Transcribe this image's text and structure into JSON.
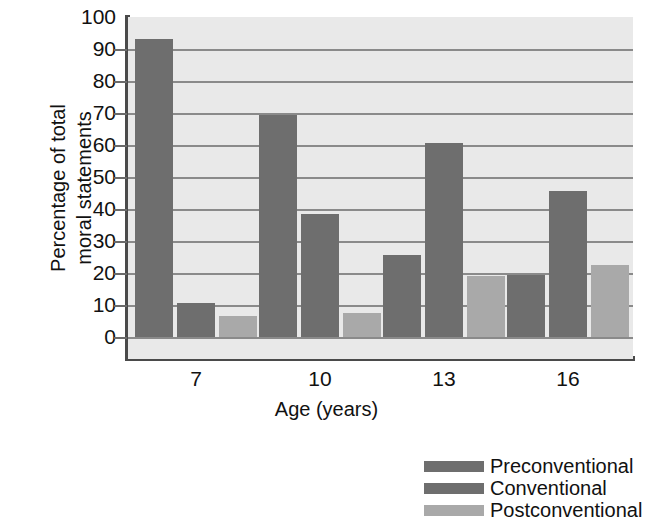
{
  "chart_data": {
    "type": "bar",
    "title": "",
    "xlabel": "Age (years)",
    "ylabel": "Percentage of total\nmoral statements",
    "categories": [
      "7",
      "10",
      "13",
      "16"
    ],
    "ylim": [
      0,
      100
    ],
    "yticks": [
      "100",
      "90",
      "80",
      "70",
      "60",
      "50",
      "40",
      "30",
      "20",
      "10",
      "0"
    ],
    "grid": true,
    "legend_position": "bottom-right",
    "series": [
      {
        "name": "Preconventional",
        "color": "#6e6e6e",
        "values": [
          93,
          69.5,
          25.5,
          19.5
        ]
      },
      {
        "name": "Conventional",
        "color": "#6e6e6e",
        "values": [
          10.5,
          38.5,
          60.5,
          45.5
        ]
      },
      {
        "name": "Postconventional",
        "color": "#a9a9a9",
        "values": [
          6.5,
          7.5,
          19,
          22.5
        ]
      }
    ]
  },
  "style": {
    "plot_background": "#e9e9e9",
    "axis_color": "#4a4a4a",
    "gridline_color": "#8a8a8a",
    "text_color": "#111111"
  }
}
